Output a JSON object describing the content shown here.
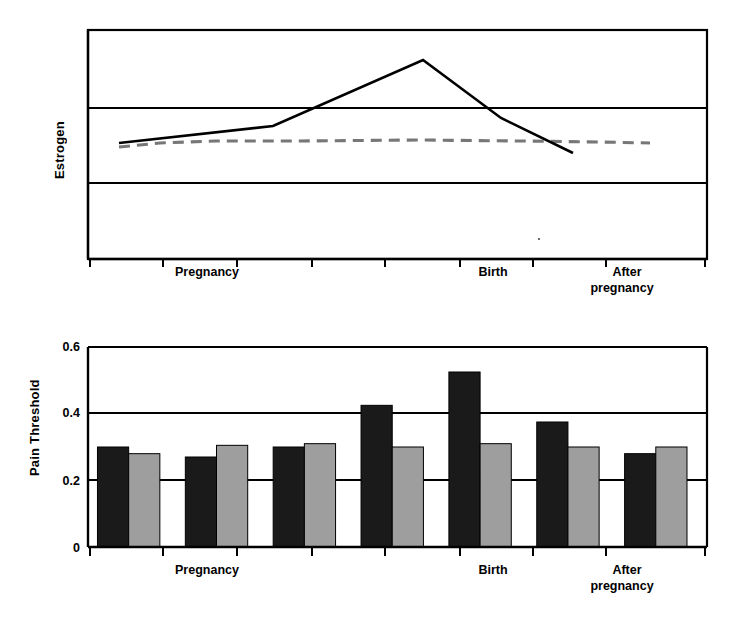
{
  "figure": {
    "background": "#ffffff",
    "ink": "#000000",
    "bar_dark_color": "#1a1a1a",
    "bar_light_color": "#9e9e9e",
    "dashed_line_color": "#777777",
    "solid_line_color": "#000000"
  },
  "charts": {
    "estrogen": {
      "ylabel": "Estrogen",
      "xcategories": [
        "Pregnancy",
        "Birth",
        "After",
        "pregnancy"
      ],
      "xlabels": [
        {
          "text": "Pregnancy",
          "x": 207
        },
        {
          "text": "Birth",
          "x": 493
        },
        {
          "text": "After",
          "x": 627
        },
        {
          "text": "pregnancy",
          "x": 622
        }
      ]
    },
    "pain": {
      "ylabel": "Pain Threshold",
      "yticks": [
        "0.6",
        "0.4",
        "0.2",
        "0"
      ],
      "xlabels": [
        {
          "text": "Pregnancy",
          "x": 207
        },
        {
          "text": "Birth",
          "x": 493
        },
        {
          "text": "After",
          "x": 627
        },
        {
          "text": "pregnancy",
          "x": 622
        }
      ]
    }
  },
  "chart_data": [
    {
      "type": "line",
      "title": "",
      "xlabel": "",
      "ylabel": "Estrogen",
      "xlim": [
        0,
        7
      ],
      "ylim": [
        0,
        3
      ],
      "grid": true,
      "gridlines_y": [
        1,
        2
      ],
      "yticklabels": [],
      "xticklabels": [
        "",
        "",
        "",
        "",
        "",
        "",
        "",
        ""
      ],
      "x_category_annotations": [
        "Pregnancy",
        "Birth",
        "After pregnancy"
      ],
      "series": [
        {
          "name": "estrogen-solid",
          "style": "solid",
          "color": "#000000",
          "x": [
            0.47,
            2.5,
            4.53,
            5.58,
            6.56
          ],
          "y": [
            1.55,
            1.78,
            2.67,
            1.89,
            1.41
          ]
        },
        {
          "name": "estrogen-dashed",
          "style": "dashed",
          "color": "#777777",
          "x": [
            0.47,
            1.0,
            1.8,
            3.0,
            4.5,
            5.6,
            6.56
          ],
          "y": [
            1.37,
            1.48,
            1.54,
            1.55,
            1.56,
            1.53,
            1.52
          ]
        }
      ]
    },
    {
      "type": "bar",
      "title": "",
      "xlabel": "",
      "ylabel": "Pain Threshold",
      "ylim": [
        0,
        0.6
      ],
      "yticks": [
        0,
        0.2,
        0.4,
        0.6
      ],
      "grid": true,
      "categories": [
        "1",
        "2",
        "3",
        "4",
        "5",
        "6",
        "7"
      ],
      "x_category_annotations": [
        "Pregnancy",
        "Birth",
        "After pregnancy"
      ],
      "series": [
        {
          "name": "dark",
          "color": "#1a1a1a",
          "values": [
            0.3,
            0.27,
            0.3,
            0.425,
            0.525,
            0.375,
            0.28
          ]
        },
        {
          "name": "light",
          "color": "#9e9e9e",
          "values": [
            0.28,
            0.305,
            0.31,
            0.3,
            0.31,
            0.3,
            0.3
          ]
        }
      ]
    }
  ]
}
